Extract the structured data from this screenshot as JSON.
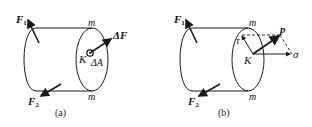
{
  "figure": {
    "panels": [
      {
        "id": "a",
        "caption": "(a)",
        "labels": {
          "f1": "F",
          "f1_sub": "1",
          "f2": "F",
          "f2_sub": "2",
          "m_top": "m",
          "m_bottom": "m",
          "delta_f": "ΔF",
          "point": "K",
          "delta_a": "ΔA"
        }
      },
      {
        "id": "b",
        "caption": "(b)",
        "labels": {
          "f1": "F",
          "f1_sub": "1",
          "f2": "F",
          "f2_sub": "2",
          "m_top": "m",
          "m_bottom": "m",
          "p": "p",
          "tau": "τ",
          "point": "K",
          "sigma": "σ"
        }
      }
    ],
    "colors": {
      "stroke": "#1a1a1a",
      "background": "#ffffff"
    }
  }
}
